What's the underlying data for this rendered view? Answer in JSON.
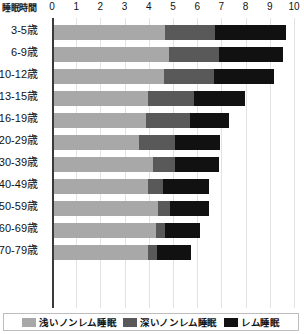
{
  "chart_data": {
    "type": "bar",
    "title": "",
    "subtitle": "",
    "xlabel": "睡眠時間",
    "ylabel": "",
    "orientation": "horizontal",
    "stacked": true,
    "grid": true,
    "legend_position": "bottom",
    "xlim": [
      0,
      10
    ],
    "xticks": [
      "0",
      "1",
      "2",
      "3",
      "4",
      "5",
      "6",
      "7",
      "8",
      "9",
      "10"
    ],
    "categories": [
      "3-5歳",
      "6-9歳",
      "10-12歳",
      "13-15歳",
      "16-19歳",
      "20-29歳",
      "30-39歳",
      "40-49歳",
      "50-59歳",
      "60-69歳",
      "70-79歳"
    ],
    "series": [
      {
        "name": "浅いノンレム睡眠",
        "color": "#a8a8a8",
        "values": [
          4.6,
          4.75,
          4.55,
          3.9,
          3.8,
          3.5,
          4.1,
          3.9,
          4.3,
          4.2,
          3.9
        ]
      },
      {
        "name": "深いノンレム睡眠",
        "color": "#595959",
        "values": [
          2.05,
          2.05,
          2.05,
          1.9,
          1.8,
          1.5,
          0.9,
          0.6,
          0.5,
          0.4,
          0.35
        ]
      },
      {
        "name": "レム睡眠",
        "color": "#111111",
        "values": [
          2.95,
          2.65,
          2.5,
          2.1,
          1.65,
          1.85,
          1.8,
          1.9,
          1.6,
          1.45,
          1.4
        ]
      }
    ],
    "totals": [
      9.6,
      9.45,
      9.1,
      7.9,
      7.25,
      6.85,
      6.8,
      6.4,
      6.4,
      6.05,
      5.65
    ]
  },
  "legend": {
    "items": [
      {
        "label": "浅いノンレム睡眠",
        "color": "#a8a8a8"
      },
      {
        "label": "深いノンレム睡眠",
        "color": "#595959"
      },
      {
        "label": "レム睡眠",
        "color": "#111111"
      }
    ]
  }
}
